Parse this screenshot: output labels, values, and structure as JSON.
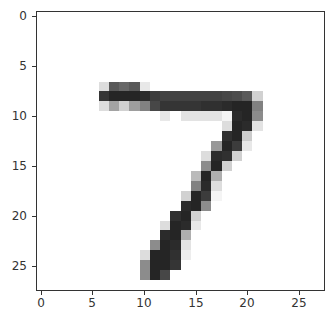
{
  "chart_data": {
    "type": "heatmap",
    "title": "",
    "xlabel": "",
    "ylabel": "",
    "colormap": "gray_r",
    "shape": [
      28,
      28
    ],
    "xlim": [
      -0.5,
      27.5
    ],
    "ylim": [
      27.5,
      -0.5
    ],
    "grid": false,
    "legend": null,
    "xticks": [
      0,
      5,
      10,
      15,
      20,
      25
    ],
    "yticks": [
      0,
      5,
      10,
      15,
      20,
      25
    ],
    "xtick_labels": [
      "0",
      "5",
      "10",
      "15",
      "20",
      "25"
    ],
    "ytick_labels": [
      "0",
      "5",
      "10",
      "15",
      "20",
      "25"
    ],
    "pixels": [
      {
        "r": 7,
        "c": 6,
        "v": 0.15
      },
      {
        "r": 7,
        "c": 7,
        "v": 0.72
      },
      {
        "r": 7,
        "c": 8,
        "v": 0.66
      },
      {
        "r": 7,
        "c": 9,
        "v": 0.72
      },
      {
        "r": 7,
        "c": 10,
        "v": 0.1
      },
      {
        "r": 8,
        "c": 6,
        "v": 0.88
      },
      {
        "r": 8,
        "c": 7,
        "v": 0.95
      },
      {
        "r": 8,
        "c": 8,
        "v": 0.95
      },
      {
        "r": 8,
        "c": 9,
        "v": 0.95
      },
      {
        "r": 8,
        "c": 10,
        "v": 0.92
      },
      {
        "r": 8,
        "c": 11,
        "v": 0.85
      },
      {
        "r": 8,
        "c": 12,
        "v": 0.82
      },
      {
        "r": 8,
        "c": 13,
        "v": 0.82
      },
      {
        "r": 8,
        "c": 14,
        "v": 0.82
      },
      {
        "r": 8,
        "c": 15,
        "v": 0.82
      },
      {
        "r": 8,
        "c": 16,
        "v": 0.82
      },
      {
        "r": 8,
        "c": 17,
        "v": 0.82
      },
      {
        "r": 8,
        "c": 18,
        "v": 0.8
      },
      {
        "r": 8,
        "c": 19,
        "v": 0.78
      },
      {
        "r": 8,
        "c": 20,
        "v": 0.72
      },
      {
        "r": 8,
        "c": 21,
        "v": 0.2
      },
      {
        "r": 9,
        "c": 6,
        "v": 0.15
      },
      {
        "r": 9,
        "c": 7,
        "v": 0.4
      },
      {
        "r": 9,
        "c": 8,
        "v": 0.2
      },
      {
        "r": 9,
        "c": 9,
        "v": 0.42
      },
      {
        "r": 9,
        "c": 10,
        "v": 0.55
      },
      {
        "r": 9,
        "c": 11,
        "v": 0.8
      },
      {
        "r": 9,
        "c": 12,
        "v": 0.88
      },
      {
        "r": 9,
        "c": 13,
        "v": 0.88
      },
      {
        "r": 9,
        "c": 14,
        "v": 0.88
      },
      {
        "r": 9,
        "c": 15,
        "v": 0.88
      },
      {
        "r": 9,
        "c": 16,
        "v": 0.9
      },
      {
        "r": 9,
        "c": 17,
        "v": 0.9
      },
      {
        "r": 9,
        "c": 18,
        "v": 0.92
      },
      {
        "r": 9,
        "c": 19,
        "v": 0.95
      },
      {
        "r": 9,
        "c": 20,
        "v": 0.95
      },
      {
        "r": 9,
        "c": 21,
        "v": 0.55
      },
      {
        "r": 10,
        "c": 12,
        "v": 0.1
      },
      {
        "r": 10,
        "c": 14,
        "v": 0.12
      },
      {
        "r": 10,
        "c": 15,
        "v": 0.12
      },
      {
        "r": 10,
        "c": 16,
        "v": 0.12
      },
      {
        "r": 10,
        "c": 17,
        "v": 0.12
      },
      {
        "r": 10,
        "c": 18,
        "v": 0.05
      },
      {
        "r": 10,
        "c": 19,
        "v": 0.92
      },
      {
        "r": 10,
        "c": 20,
        "v": 0.95
      },
      {
        "r": 10,
        "c": 21,
        "v": 0.5
      },
      {
        "r": 11,
        "c": 18,
        "v": 0.15
      },
      {
        "r": 11,
        "c": 19,
        "v": 0.95
      },
      {
        "r": 11,
        "c": 20,
        "v": 0.92
      },
      {
        "r": 11,
        "c": 21,
        "v": 0.12
      },
      {
        "r": 12,
        "c": 18,
        "v": 0.9
      },
      {
        "r": 12,
        "c": 19,
        "v": 0.95
      },
      {
        "r": 12,
        "c": 20,
        "v": 0.22
      },
      {
        "r": 13,
        "c": 17,
        "v": 0.45
      },
      {
        "r": 13,
        "c": 18,
        "v": 0.95
      },
      {
        "r": 13,
        "c": 19,
        "v": 0.85
      },
      {
        "r": 13,
        "c": 20,
        "v": 0.1
      },
      {
        "r": 14,
        "c": 16,
        "v": 0.15
      },
      {
        "r": 14,
        "c": 17,
        "v": 0.92
      },
      {
        "r": 14,
        "c": 18,
        "v": 0.9
      },
      {
        "r": 14,
        "c": 19,
        "v": 0.2
      },
      {
        "r": 15,
        "c": 16,
        "v": 0.5
      },
      {
        "r": 15,
        "c": 17,
        "v": 0.95
      },
      {
        "r": 15,
        "c": 18,
        "v": 0.2
      },
      {
        "r": 16,
        "c": 15,
        "v": 0.3
      },
      {
        "r": 16,
        "c": 16,
        "v": 0.95
      },
      {
        "r": 16,
        "c": 17,
        "v": 0.35
      },
      {
        "r": 17,
        "c": 15,
        "v": 0.55
      },
      {
        "r": 17,
        "c": 16,
        "v": 0.92
      },
      {
        "r": 17,
        "c": 17,
        "v": 0.15
      },
      {
        "r": 18,
        "c": 14,
        "v": 0.2
      },
      {
        "r": 18,
        "c": 15,
        "v": 0.95
      },
      {
        "r": 18,
        "c": 16,
        "v": 0.85
      },
      {
        "r": 18,
        "c": 17,
        "v": 0.05
      },
      {
        "r": 19,
        "c": 14,
        "v": 0.92
      },
      {
        "r": 19,
        "c": 15,
        "v": 0.95
      },
      {
        "r": 19,
        "c": 16,
        "v": 0.5
      },
      {
        "r": 20,
        "c": 13,
        "v": 0.9
      },
      {
        "r": 20,
        "c": 14,
        "v": 0.95
      },
      {
        "r": 20,
        "c": 15,
        "v": 0.2
      },
      {
        "r": 21,
        "c": 12,
        "v": 0.15
      },
      {
        "r": 21,
        "c": 13,
        "v": 0.95
      },
      {
        "r": 21,
        "c": 14,
        "v": 0.92
      },
      {
        "r": 21,
        "c": 15,
        "v": 0.1
      },
      {
        "r": 22,
        "c": 12,
        "v": 0.92
      },
      {
        "r": 22,
        "c": 13,
        "v": 0.95
      },
      {
        "r": 22,
        "c": 14,
        "v": 0.35
      },
      {
        "r": 23,
        "c": 11,
        "v": 0.5
      },
      {
        "r": 23,
        "c": 12,
        "v": 0.95
      },
      {
        "r": 23,
        "c": 13,
        "v": 0.92
      },
      {
        "r": 23,
        "c": 14,
        "v": 0.12
      },
      {
        "r": 24,
        "c": 10,
        "v": 0.15
      },
      {
        "r": 24,
        "c": 11,
        "v": 0.95
      },
      {
        "r": 24,
        "c": 12,
        "v": 0.95
      },
      {
        "r": 24,
        "c": 13,
        "v": 0.9
      },
      {
        "r": 24,
        "c": 14,
        "v": 0.08
      },
      {
        "r": 25,
        "c": 10,
        "v": 0.5
      },
      {
        "r": 25,
        "c": 11,
        "v": 0.95
      },
      {
        "r": 25,
        "c": 12,
        "v": 0.95
      },
      {
        "r": 25,
        "c": 13,
        "v": 0.88
      },
      {
        "r": 26,
        "c": 10,
        "v": 0.5
      },
      {
        "r": 26,
        "c": 11,
        "v": 0.95
      },
      {
        "r": 26,
        "c": 12,
        "v": 0.8
      }
    ]
  },
  "axes": {
    "frame_color": "#333333",
    "tick_color": "#333333",
    "label_color": "#333333"
  }
}
